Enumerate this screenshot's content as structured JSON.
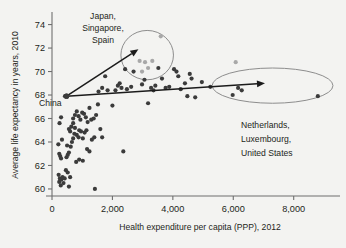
{
  "chart_data": {
    "type": "scatter",
    "title": "",
    "xlabel": "Health expenditure per capita (PPP), 2012",
    "ylabel": "Average life expectancy in years, 2010",
    "xlim": [
      0,
      9400
    ],
    "ylim": [
      59.4,
      74.9
    ],
    "xticks": [
      0,
      2000,
      4000,
      6000,
      8000
    ],
    "xticklabels": [
      "0",
      "2,000",
      "4,000",
      "6,000",
      "8,000"
    ],
    "yticks": [
      60,
      62,
      64,
      66,
      68,
      70,
      72,
      74
    ],
    "yticklabels": [
      "60",
      "62",
      "64",
      "66",
      "68",
      "70",
      "72",
      "74"
    ],
    "grid": false,
    "legend": null,
    "series": [
      {
        "name": "countries",
        "color": "#3b3b3b",
        "points": [
          [
            430,
            67.9
          ],
          [
            300,
            66.1
          ],
          [
            250,
            65.6
          ],
          [
            210,
            63.8
          ],
          [
            330,
            64.2
          ],
          [
            240,
            63.0
          ],
          [
            270,
            62.8
          ],
          [
            300,
            62.6
          ],
          [
            220,
            61.2
          ],
          [
            260,
            60.9
          ],
          [
            240,
            60.6
          ],
          [
            310,
            60.8
          ],
          [
            350,
            61.0
          ],
          [
            290,
            60.3
          ],
          [
            380,
            60.5
          ],
          [
            420,
            60.9
          ],
          [
            460,
            61.6
          ],
          [
            520,
            61.4
          ],
          [
            560,
            60.2
          ],
          [
            600,
            61.0
          ],
          [
            480,
            62.7
          ],
          [
            520,
            62.9
          ],
          [
            560,
            63.1
          ],
          [
            500,
            63.7
          ],
          [
            620,
            63.6
          ],
          [
            660,
            64.0
          ],
          [
            700,
            64.3
          ],
          [
            740,
            64.7
          ],
          [
            600,
            64.9
          ],
          [
            560,
            65.1
          ],
          [
            640,
            65.3
          ],
          [
            700,
            65.6
          ],
          [
            760,
            65.2
          ],
          [
            820,
            64.6
          ],
          [
            880,
            64.4
          ],
          [
            700,
            66.0
          ],
          [
            760,
            66.3
          ],
          [
            820,
            66.6
          ],
          [
            880,
            66.2
          ],
          [
            940,
            65.9
          ],
          [
            900,
            65.0
          ],
          [
            960,
            64.9
          ],
          [
            1020,
            64.3
          ],
          [
            1080,
            64.8
          ],
          [
            1140,
            65.0
          ],
          [
            1000,
            66.5
          ],
          [
            1060,
            66.4
          ],
          [
            1120,
            66.1
          ],
          [
            1180,
            65.7
          ],
          [
            1240,
            66.9
          ],
          [
            1160,
            63.4
          ],
          [
            1240,
            63.2
          ],
          [
            1320,
            64.2
          ],
          [
            1400,
            64.4
          ],
          [
            1300,
            65.9
          ],
          [
            1380,
            66.0
          ],
          [
            1460,
            66.3
          ],
          [
            1520,
            67.2
          ],
          [
            1600,
            65.1
          ],
          [
            1660,
            64.4
          ],
          [
            1420,
            60.0
          ],
          [
            1020,
            62.4
          ],
          [
            900,
            62.5
          ],
          [
            800,
            62.3
          ],
          [
            1540,
            68.3
          ],
          [
            1660,
            68.6
          ],
          [
            1760,
            69.6
          ],
          [
            1840,
            68.4
          ],
          [
            2000,
            67.1
          ],
          [
            2100,
            68.4
          ],
          [
            2180,
            68.8
          ],
          [
            2240,
            69.0
          ],
          [
            2300,
            68.6
          ],
          [
            2360,
            63.2
          ],
          [
            2420,
            70.2
          ],
          [
            2480,
            68.5
          ],
          [
            2620,
            68.7
          ],
          [
            2700,
            70.0
          ],
          [
            2980,
            68.9
          ],
          [
            3060,
            69.3
          ],
          [
            3180,
            67.3
          ],
          [
            3280,
            68.6
          ],
          [
            3360,
            68.4
          ],
          [
            3420,
            68.8
          ],
          [
            3520,
            70.3
          ],
          [
            3640,
            69.4
          ],
          [
            3760,
            68.6
          ],
          [
            3880,
            68.7
          ],
          [
            4040,
            70.2
          ],
          [
            4120,
            70.0
          ],
          [
            4180,
            69.6
          ],
          [
            4260,
            68.5
          ],
          [
            4400,
            69.0
          ],
          [
            4480,
            67.9
          ],
          [
            4560,
            69.8
          ],
          [
            4620,
            69.4
          ],
          [
            4740,
            67.8
          ],
          [
            4960,
            69.1
          ],
          [
            5240,
            68.7
          ],
          [
            5980,
            68.0
          ],
          [
            6280,
            68.4
          ],
          [
            6160,
            68.6
          ],
          [
            8800,
            67.9
          ]
        ]
      },
      {
        "name": "highlighted",
        "color": "#a8a8a8",
        "points": [
          [
            3600,
            73.0
          ],
          [
            3080,
            70.8
          ],
          [
            2900,
            70.9
          ],
          [
            3180,
            70.3
          ],
          [
            3320,
            70.9
          ],
          [
            2980,
            70.0
          ],
          [
            6080,
            70.8
          ]
        ]
      }
    ],
    "annotations": [
      {
        "name": "japan-singapore-spain-label",
        "lines": [
          "Japan,",
          "Singapore,",
          "Spain"
        ],
        "align": "center"
      },
      {
        "name": "netherlands-luxembourg-us-label",
        "lines": [
          "Netherlands,",
          "Luxembourg,",
          "United States"
        ],
        "align": "left"
      },
      {
        "name": "china-label",
        "lines": [
          "China"
        ],
        "align": "left"
      }
    ],
    "highlight_regions": [
      {
        "name": "upper-circle",
        "shape": "ellipse",
        "center_x": 3150,
        "center_y": 71.4,
        "rx": 870,
        "ry": 2.1
      },
      {
        "name": "right-ellipse",
        "shape": "ellipse",
        "center_x": 7300,
        "center_y": 68.8,
        "rx": 2000,
        "ry": 1.5
      }
    ],
    "arrows": [
      {
        "name": "arrow-to-top-circle",
        "x1": 480,
        "y1": 67.9,
        "x2": 2860,
        "y2": 71.9
      },
      {
        "name": "arrow-to-right-ellipse",
        "x1": 480,
        "y1": 67.9,
        "x2": 7050,
        "y2": 69.0
      }
    ]
  },
  "axes": {
    "x_title": "Health expenditure per capita (PPP), 2012",
    "y_title": "Average life expectancy in years, 2010"
  },
  "labels": {
    "china": "China",
    "japan_line1": "Japan,",
    "japan_line2": "Singapore,",
    "japan_line3": "Spain",
    "neth_line1": "Netherlands,",
    "neth_line2": "Luxembourg,",
    "neth_line3": "United States"
  },
  "colors": {
    "background": "#f3f3f1",
    "dot": "#3b3b3b",
    "dot_highlight": "#a8a8a8",
    "axis": "#6f6f6f",
    "ellipse": "#8d8d8d",
    "arrow": "#1b1b1b",
    "text": "#231f20"
  }
}
